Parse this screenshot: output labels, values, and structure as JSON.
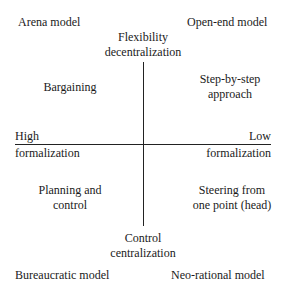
{
  "diagram": {
    "type": "quadrant",
    "axes": {
      "vertical": {
        "top_label": [
          "Flexibility",
          "decentralization"
        ],
        "bottom_label": [
          "Control",
          "centralization"
        ]
      },
      "horizontal": {
        "left_label": [
          "High",
          "formalization"
        ],
        "right_label": [
          "Low",
          "formalization"
        ]
      }
    },
    "corners": {
      "top_left": "Arena model",
      "top_right": "Open-end model",
      "bottom_left": "Bureaucratic model",
      "bottom_right": "Neo-rational model"
    },
    "quadrants": {
      "top_left": [
        "Bargaining"
      ],
      "top_right": [
        "Step-by-step",
        "approach"
      ],
      "bottom_left": [
        "Planning and",
        "control"
      ],
      "bottom_right": [
        "Steering from",
        "one point (head)"
      ]
    }
  }
}
